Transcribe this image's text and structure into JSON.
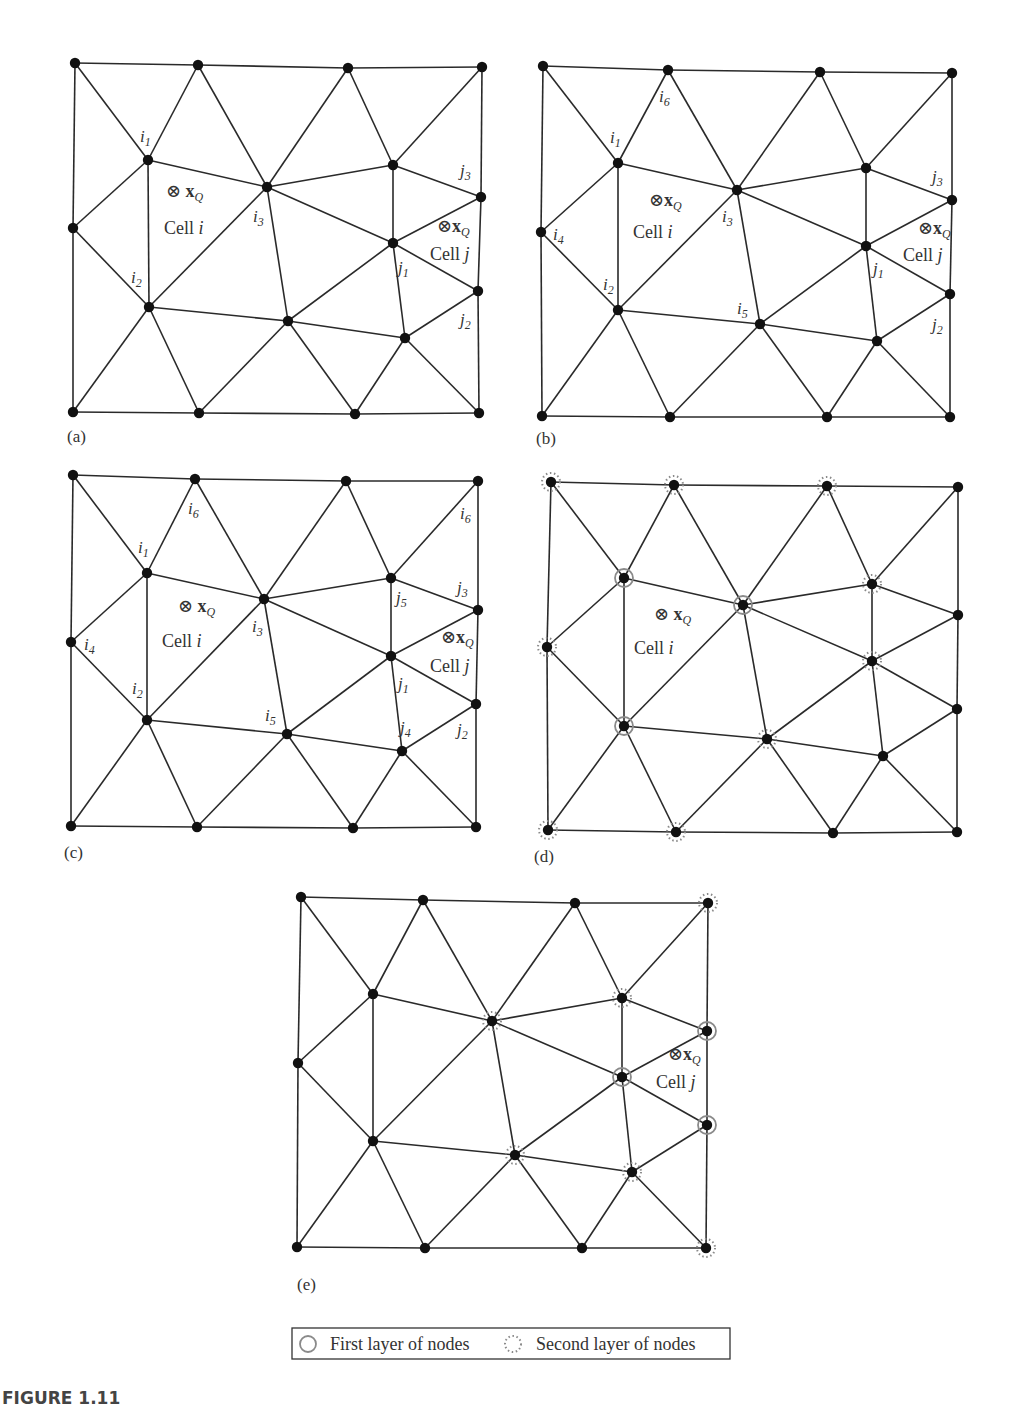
{
  "figure": {
    "caption": "FIGURE 1.11",
    "legend": {
      "first_layer": "First layer of nodes",
      "second_layer": "Second layer of nodes",
      "first_layer_icon": "solid-gray-ring",
      "second_layer_icon": "dotted-gray-ring"
    },
    "colors": {
      "edge": "#2a2a2a",
      "node": "#111111",
      "ring": "#8a8a8a",
      "text": "#333333"
    },
    "edges": [
      [
        0,
        1
      ],
      [
        1,
        2
      ],
      [
        2,
        3
      ],
      [
        0,
        8
      ],
      [
        8,
        14
      ],
      [
        3,
        7
      ],
      [
        7,
        10
      ],
      [
        10,
        17
      ],
      [
        14,
        15
      ],
      [
        15,
        16
      ],
      [
        16,
        17
      ],
      [
        0,
        4
      ],
      [
        1,
        4
      ],
      [
        1,
        5
      ],
      [
        2,
        5
      ],
      [
        2,
        6
      ],
      [
        3,
        6
      ],
      [
        4,
        5
      ],
      [
        4,
        8
      ],
      [
        4,
        11
      ],
      [
        5,
        11
      ],
      [
        5,
        6
      ],
      [
        5,
        9
      ],
      [
        5,
        12
      ],
      [
        6,
        7
      ],
      [
        6,
        9
      ],
      [
        7,
        9
      ],
      [
        9,
        10
      ],
      [
        9,
        12
      ],
      [
        9,
        13
      ],
      [
        10,
        13
      ],
      [
        8,
        11
      ],
      [
        11,
        12
      ],
      [
        12,
        13
      ],
      [
        11,
        14
      ],
      [
        11,
        15
      ],
      [
        12,
        15
      ],
      [
        12,
        16
      ],
      [
        13,
        16
      ],
      [
        13,
        17
      ]
    ],
    "panels": [
      {
        "id": "a",
        "label": "(a)",
        "label_pos": [
          67,
          442
        ],
        "nodes": [
          [
            75,
            63
          ],
          [
            198,
            65
          ],
          [
            348,
            68
          ],
          [
            482,
            67
          ],
          [
            148,
            160
          ],
          [
            267,
            187
          ],
          [
            393,
            165
          ],
          [
            481,
            197
          ],
          [
            73,
            228
          ],
          [
            393,
            243
          ],
          [
            478,
            291
          ],
          [
            149,
            307
          ],
          [
            288,
            321
          ],
          [
            405,
            338
          ],
          [
            73,
            412
          ],
          [
            199,
            413
          ],
          [
            355,
            414
          ],
          [
            479,
            413
          ]
        ],
        "first_layer": [],
        "second_layer": [],
        "node_labels": [
          {
            "t": "i",
            "s": "1",
            "x": 140,
            "y": 142
          },
          {
            "t": "i",
            "s": "3",
            "x": 253,
            "y": 222
          },
          {
            "t": "i",
            "s": "2",
            "x": 131,
            "y": 283
          },
          {
            "t": "j",
            "s": "3",
            "x": 460,
            "y": 176
          },
          {
            "t": "j",
            "s": "1",
            "x": 398,
            "y": 273
          },
          {
            "t": "j",
            "s": "2",
            "x": 460,
            "y": 325
          }
        ],
        "points": [
          {
            "x": 166,
            "y": 197,
            "gap": " "
          },
          {
            "x": 437,
            "y": 232,
            "gap": ""
          }
        ],
        "cells": [
          {
            "name": "Cell ",
            "var": "i",
            "x": 164,
            "y": 234
          },
          {
            "name": "Cell ",
            "var": "j",
            "x": 430,
            "y": 260
          }
        ]
      },
      {
        "id": "b",
        "label": "(b)",
        "label_pos": [
          536,
          444
        ],
        "nodes": [
          [
            543,
            66
          ],
          [
            668,
            70
          ],
          [
            820,
            72
          ],
          [
            952,
            73
          ],
          [
            618,
            163
          ],
          [
            737,
            190
          ],
          [
            866,
            168
          ],
          [
            952,
            200
          ],
          [
            541,
            232
          ],
          [
            866,
            246
          ],
          [
            950,
            294
          ],
          [
            618,
            310
          ],
          [
            760,
            324
          ],
          [
            877,
            341
          ],
          [
            542,
            416
          ],
          [
            670,
            417
          ],
          [
            827,
            417
          ],
          [
            950,
            417
          ]
        ],
        "first_layer": [],
        "second_layer": [],
        "node_labels": [
          {
            "t": "i",
            "s": "6",
            "x": 659,
            "y": 102
          },
          {
            "t": "i",
            "s": "1",
            "x": 610,
            "y": 143
          },
          {
            "t": "i",
            "s": "3",
            "x": 722,
            "y": 222
          },
          {
            "t": "i",
            "s": "4",
            "x": 553,
            "y": 240
          },
          {
            "t": "i",
            "s": "2",
            "x": 603,
            "y": 290
          },
          {
            "t": "i",
            "s": "5",
            "x": 737,
            "y": 314
          },
          {
            "t": "j",
            "s": "3",
            "x": 932,
            "y": 182
          },
          {
            "t": "j",
            "s": "1",
            "x": 873,
            "y": 274
          },
          {
            "t": "j",
            "s": "2",
            "x": 932,
            "y": 330
          }
        ],
        "points": [
          {
            "x": 649,
            "y": 206,
            "gap": ""
          },
          {
            "x": 918,
            "y": 234,
            "gap": ""
          }
        ],
        "cells": [
          {
            "name": "Cell ",
            "var": "i",
            "x": 633,
            "y": 238
          },
          {
            "name": "Cell ",
            "var": "j",
            "x": 903,
            "y": 261
          }
        ]
      },
      {
        "id": "c",
        "label": "(c)",
        "label_pos": [
          64,
          858
        ],
        "nodes": [
          [
            73,
            475
          ],
          [
            195,
            479
          ],
          [
            346,
            481
          ],
          [
            478,
            481
          ],
          [
            147,
            573
          ],
          [
            264,
            599
          ],
          [
            391,
            578
          ],
          [
            478,
            610
          ],
          [
            71,
            642
          ],
          [
            391,
            656
          ],
          [
            476,
            704
          ],
          [
            147,
            720
          ],
          [
            287,
            734
          ],
          [
            402,
            751
          ],
          [
            71,
            826
          ],
          [
            197,
            827
          ],
          [
            353,
            828
          ],
          [
            476,
            827
          ]
        ],
        "first_layer": [],
        "second_layer": [],
        "node_labels": [
          {
            "t": "i",
            "s": "6",
            "x": 188,
            "y": 514
          },
          {
            "t": "i",
            "s": "1",
            "x": 138,
            "y": 553
          },
          {
            "t": "i",
            "s": "3",
            "x": 252,
            "y": 632
          },
          {
            "t": "i",
            "s": "4",
            "x": 84,
            "y": 650
          },
          {
            "t": "i",
            "s": "2",
            "x": 132,
            "y": 694
          },
          {
            "t": "i",
            "s": "5",
            "x": 265,
            "y": 721
          },
          {
            "t": "i",
            "s": "6",
            "x": 460,
            "y": 519
          },
          {
            "t": "j",
            "s": "5",
            "x": 396,
            "y": 603
          },
          {
            "t": "j",
            "s": "3",
            "x": 457,
            "y": 593
          },
          {
            "t": "j",
            "s": "1",
            "x": 398,
            "y": 689
          },
          {
            "t": "j",
            "s": "4",
            "x": 400,
            "y": 733
          },
          {
            "t": "j",
            "s": "2",
            "x": 457,
            "y": 735
          }
        ],
        "points": [
          {
            "x": 178,
            "y": 612,
            "gap": " "
          },
          {
            "x": 441,
            "y": 643,
            "gap": ""
          }
        ],
        "cells": [
          {
            "name": "Cell ",
            "var": "i",
            "x": 162,
            "y": 647
          },
          {
            "name": "Cell ",
            "var": "j",
            "x": 430,
            "y": 672
          }
        ]
      },
      {
        "id": "d",
        "label": "(d)",
        "label_pos": [
          534,
          862
        ],
        "nodes": [
          [
            551,
            482
          ],
          [
            674,
            485
          ],
          [
            827,
            486
          ],
          [
            958,
            487
          ],
          [
            624,
            578
          ],
          [
            743,
            605
          ],
          [
            872,
            584
          ],
          [
            958,
            615
          ],
          [
            547,
            647
          ],
          [
            872,
            661
          ],
          [
            957,
            709
          ],
          [
            624,
            726
          ],
          [
            767,
            739
          ],
          [
            883,
            756
          ],
          [
            548,
            830
          ],
          [
            676,
            832
          ],
          [
            833,
            833
          ],
          [
            957,
            832
          ]
        ],
        "first_layer": [
          4,
          5,
          11
        ],
        "second_layer": [
          0,
          1,
          2,
          6,
          8,
          9,
          12,
          14,
          15
        ],
        "node_labels": [],
        "points": [
          {
            "x": 654,
            "y": 620,
            "gap": " "
          }
        ],
        "cells": [
          {
            "name": "Cell ",
            "var": "i",
            "x": 634,
            "y": 654
          }
        ]
      },
      {
        "id": "e",
        "label": "(e)",
        "label_pos": [
          297,
          1290
        ],
        "nodes": [
          [
            301,
            897
          ],
          [
            423,
            900
          ],
          [
            575,
            903
          ],
          [
            708,
            903
          ],
          [
            373,
            994
          ],
          [
            492,
            1021
          ],
          [
            622,
            998
          ],
          [
            707,
            1031
          ],
          [
            298,
            1063
          ],
          [
            622,
            1077
          ],
          [
            707,
            1125
          ],
          [
            373,
            1141
          ],
          [
            515,
            1155
          ],
          [
            632,
            1172
          ],
          [
            297,
            1247
          ],
          [
            425,
            1248
          ],
          [
            582,
            1248
          ],
          [
            706,
            1248
          ]
        ],
        "first_layer": [
          7,
          9,
          10
        ],
        "second_layer": [
          3,
          5,
          6,
          12,
          13,
          17
        ],
        "node_labels": [],
        "points": [
          {
            "x": 668,
            "y": 1060,
            "gap": ""
          }
        ],
        "cells": [
          {
            "name": "Cell ",
            "var": "j",
            "x": 656,
            "y": 1088
          }
        ]
      }
    ],
    "legend_box": {
      "x": 292,
      "y": 1328,
      "w": 438,
      "h": 31
    }
  }
}
